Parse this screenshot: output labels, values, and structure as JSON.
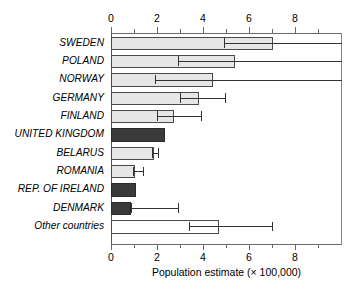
{
  "chart_data": {
    "type": "bar",
    "orientation": "horizontal",
    "title": "",
    "xlabel": "Population estimate (× 100,000)",
    "ylabel": "",
    "xlim": [
      0,
      10.05
    ],
    "grid": false,
    "legend": null,
    "xticks": [
      0,
      2,
      4,
      6,
      8
    ],
    "xtick_labels": [
      "0",
      "2",
      "4",
      "6",
      "8"
    ],
    "xminor_ticks": [
      1,
      3,
      5,
      7,
      9
    ],
    "axes_shown": [
      "top",
      "bottom"
    ],
    "categories": [
      "SWEDEN",
      "POLAND",
      "NORWAY",
      "GERMANY",
      "FINLAND",
      "UNITED KINGDOM",
      "BELARUS",
      "ROMANIA",
      "REP. OF IRELAND",
      "DENMARK",
      "Other countries"
    ],
    "values": [
      7.05,
      5.4,
      4.45,
      3.85,
      2.75,
      2.35,
      1.85,
      1.05,
      1.1,
      0.85,
      4.7
    ],
    "error_low": [
      4.9,
      2.9,
      1.9,
      3.0,
      2.0,
      null,
      1.8,
      0.95,
      null,
      0.85,
      3.4
    ],
    "error_high": [
      10.05,
      10.05,
      10.05,
      4.95,
      3.9,
      null,
      2.05,
      1.4,
      null,
      2.9,
      7.0
    ],
    "error_high_clipped": [
      true,
      true,
      true,
      false,
      false,
      false,
      false,
      false,
      false,
      false,
      false
    ],
    "bar_styles": [
      "light",
      "light",
      "light",
      "light",
      "light",
      "dark",
      "light",
      "light",
      "dark",
      "dark",
      "white"
    ],
    "annotations": []
  },
  "colors": {
    "bar_light": "#e6e6e6",
    "bar_dark": "#3a3a3a",
    "bar_white": "#ffffff",
    "bar_edge": "#4a4a4a",
    "axis": "#6a6a6a",
    "error_bar": "#333333",
    "background": "#ffffff"
  }
}
